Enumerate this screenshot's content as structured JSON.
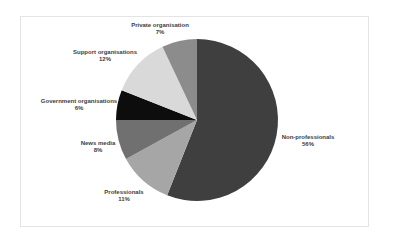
{
  "chart_data": {
    "type": "pie",
    "title": "",
    "categories": [
      "Non-professionals",
      "Professionals",
      "News media",
      "Government organisations",
      "Support organisations",
      "Private organisation"
    ],
    "values": [
      56,
      11,
      8,
      6,
      12,
      7
    ],
    "unit": "%",
    "colors": [
      "#3f3f3f",
      "#a6a6a6",
      "#707070",
      "#0d0d0d",
      "#d9d9d9",
      "#8c8c8c"
    ],
    "start_angle_deg": 0,
    "direction": "clockwise",
    "legend": "none",
    "data_labels": "category and percentage outside slices"
  },
  "labels": [
    {
      "name": "Non-professionals",
      "pct": "56%"
    },
    {
      "name": "Professionals",
      "pct": "11%"
    },
    {
      "name": "News media",
      "pct": "8%"
    },
    {
      "name": "Government organisations",
      "pct": "6%"
    },
    {
      "name": "Support organisations",
      "pct": "12%"
    },
    {
      "name": "Private organisation",
      "pct": "7%"
    }
  ]
}
